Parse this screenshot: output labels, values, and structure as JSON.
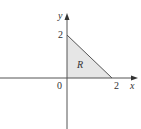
{
  "figure": {
    "type": "region-diagram",
    "region_label": "R",
    "axes": {
      "x_label": "x",
      "y_label": "y",
      "origin_label": "0",
      "x_tick_label": "2",
      "y_tick_label": "2"
    },
    "region": {
      "shape": "triangle",
      "vertices": [
        [
          0,
          0
        ],
        [
          2,
          0
        ],
        [
          0,
          2
        ]
      ],
      "fill_color": "#e6e6e6",
      "edge_color": "#555555"
    },
    "axis_color": "#555555"
  }
}
